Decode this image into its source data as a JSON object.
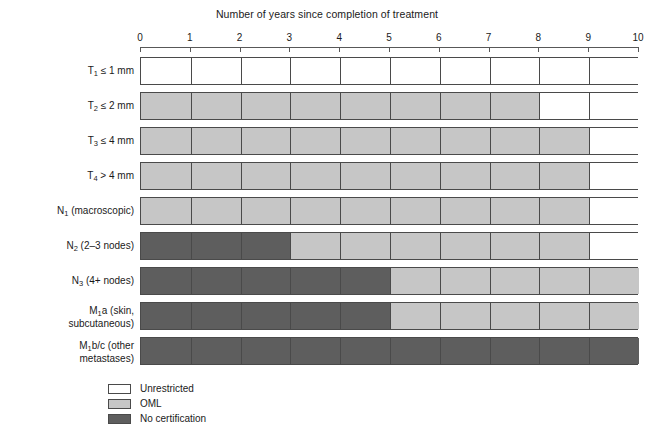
{
  "chart_data": {
    "type": "bar",
    "title": "Number of years since completion of treatment",
    "xlabel": "",
    "ylabel": "",
    "xlim": [
      0,
      10
    ],
    "grid": true,
    "legend_position": "bottom-left",
    "tick_labels": [
      "0",
      "1",
      "2",
      "3",
      "4",
      "5",
      "6",
      "7",
      "8",
      "9",
      "10"
    ],
    "tick_values": [
      0,
      1,
      2,
      3,
      4,
      5,
      6,
      7,
      8,
      9,
      10
    ],
    "categories": [
      "T1 ≤ 1 mm",
      "T2 ≤ 2 mm",
      "T3 ≤ 4 mm",
      "T4 > 4 mm",
      "N1 (macroscopic)",
      "N2 (2–3 nodes)",
      "N3 (4+ nodes)",
      "M1a (skin, subcutaneous)",
      "M1b/c (other metastases)"
    ],
    "legend": [
      {
        "key": "unrestricted",
        "label": "Unrestricted",
        "color": "#ffffff"
      },
      {
        "key": "oml",
        "label": "OML",
        "color": "#c6c6c6"
      },
      {
        "key": "none",
        "label": "No certification",
        "color": "#5e5e5e"
      }
    ],
    "rows": [
      {
        "label_html": "T<sub>1</sub> ≤ 1 mm",
        "label_text": "T1 ≤ 1 mm",
        "segments": [
          {
            "status": "unrestricted",
            "start": 0,
            "end": 10
          }
        ]
      },
      {
        "label_html": "T<sub>2</sub> ≤ 2 mm",
        "label_text": "T2 ≤ 2 mm",
        "segments": [
          {
            "status": "oml",
            "start": 0,
            "end": 8
          },
          {
            "status": "unrestricted",
            "start": 8,
            "end": 10
          }
        ]
      },
      {
        "label_html": "T<sub>3</sub> ≤ 4 mm",
        "label_text": "T3 ≤ 4 mm",
        "segments": [
          {
            "status": "oml",
            "start": 0,
            "end": 9
          },
          {
            "status": "unrestricted",
            "start": 9,
            "end": 10
          }
        ]
      },
      {
        "label_html": "T<sub>4</sub> > 4 mm",
        "label_text": "T4 > 4 mm",
        "segments": [
          {
            "status": "oml",
            "start": 0,
            "end": 9
          },
          {
            "status": "unrestricted",
            "start": 9,
            "end": 10
          }
        ]
      },
      {
        "label_html": "N<sub>1</sub> (macroscopic)",
        "label_text": "N1 (macroscopic)",
        "segments": [
          {
            "status": "oml",
            "start": 0,
            "end": 9
          },
          {
            "status": "unrestricted",
            "start": 9,
            "end": 10
          }
        ]
      },
      {
        "label_html": "N<sub>2</sub> (2–3 nodes)",
        "label_text": "N2 (2–3 nodes)",
        "segments": [
          {
            "status": "none",
            "start": 0,
            "end": 3
          },
          {
            "status": "oml",
            "start": 3,
            "end": 9
          },
          {
            "status": "unrestricted",
            "start": 9,
            "end": 10
          }
        ]
      },
      {
        "label_html": "N<sub>3</sub> (4+ nodes)",
        "label_text": "N3 (4+ nodes)",
        "segments": [
          {
            "status": "none",
            "start": 0,
            "end": 5
          },
          {
            "status": "oml",
            "start": 5,
            "end": 10
          }
        ]
      },
      {
        "label_html": "M<sub>1</sub>a (skin,\nsubcutaneous)",
        "label_text": "M1a (skin, subcutaneous)",
        "segments": [
          {
            "status": "none",
            "start": 0,
            "end": 5
          },
          {
            "status": "oml",
            "start": 5,
            "end": 10
          }
        ]
      },
      {
        "label_html": "M<sub>1</sub>b/c (other\nmetastases)",
        "label_text": "M1b/c (other metastases)",
        "segments": [
          {
            "status": "none",
            "start": 0,
            "end": 10
          }
        ]
      }
    ]
  }
}
